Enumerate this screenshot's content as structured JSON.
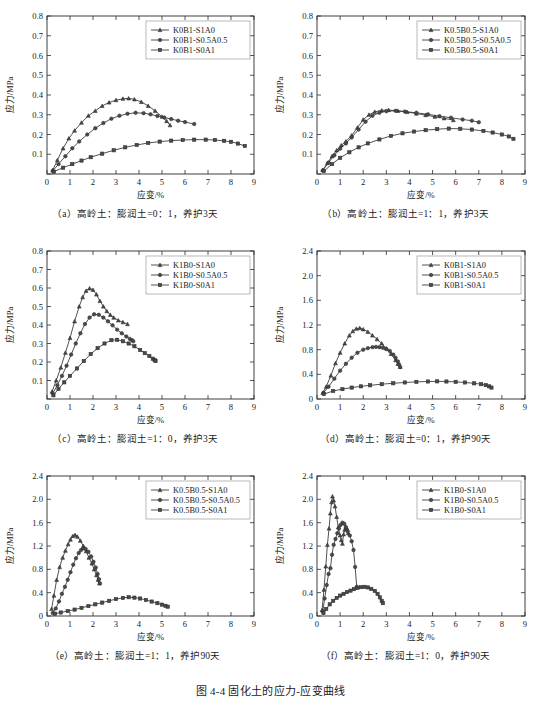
{
  "figure": {
    "caption": "图 4-4  固化土的应力-应变曲线",
    "axis_x_label": "应变/%",
    "axis_y_label": "应力/MPa"
  },
  "chart_data": [
    {
      "id": "a",
      "type": "line",
      "title": "（a）高岭土：膨润土=0：1，养护3天",
      "xlabel": "应变/%",
      "ylabel": "应力/MPa",
      "xlim": [
        0,
        9
      ],
      "ylim": [
        0,
        0.8
      ],
      "xticks": [
        0,
        1,
        2,
        3,
        4,
        5,
        6,
        7,
        8,
        9
      ],
      "yticks": [
        0,
        0.1,
        0.2,
        0.3,
        0.4,
        0.5,
        0.6,
        0.7,
        0.8
      ],
      "ytick_labels": [
        "",
        "0.1",
        "0.2",
        "0.3",
        "0.4",
        "0.5",
        "0.6",
        "0.7",
        "0.8"
      ],
      "grid": false,
      "legend_position": "top-right",
      "series": [
        {
          "name": "K0B1-S1A0",
          "marker": "triangle",
          "x": [
            0.25,
            0.45,
            0.7,
            0.95,
            1.2,
            1.5,
            1.8,
            2.1,
            2.4,
            2.7,
            3.0,
            3.3,
            3.55,
            3.8,
            4.1,
            4.4,
            4.7,
            5.0,
            5.2,
            5.35
          ],
          "y": [
            0.02,
            0.07,
            0.13,
            0.18,
            0.22,
            0.26,
            0.295,
            0.32,
            0.345,
            0.362,
            0.374,
            0.381,
            0.383,
            0.378,
            0.365,
            0.345,
            0.32,
            0.29,
            0.268,
            0.247
          ]
        },
        {
          "name": "K0B1-S0.5A0.5",
          "marker": "circle",
          "x": [
            0.25,
            0.5,
            0.8,
            1.1,
            1.4,
            1.75,
            2.1,
            2.45,
            2.8,
            3.15,
            3.5,
            3.85,
            4.2,
            4.5,
            4.8,
            5.1,
            5.4,
            5.7,
            6.0,
            6.4
          ],
          "y": [
            0.015,
            0.05,
            0.09,
            0.13,
            0.165,
            0.2,
            0.232,
            0.258,
            0.28,
            0.295,
            0.305,
            0.31,
            0.308,
            0.302,
            0.294,
            0.286,
            0.278,
            0.27,
            0.263,
            0.253
          ]
        },
        {
          "name": "K0B1-S0A1",
          "marker": "square",
          "x": [
            0.3,
            0.7,
            1.1,
            1.5,
            1.9,
            2.4,
            2.9,
            3.4,
            3.9,
            4.4,
            4.9,
            5.4,
            5.9,
            6.4,
            6.9,
            7.3,
            7.7,
            8.0,
            8.3,
            8.6
          ],
          "y": [
            0.012,
            0.032,
            0.05,
            0.068,
            0.085,
            0.103,
            0.12,
            0.135,
            0.147,
            0.157,
            0.164,
            0.169,
            0.172,
            0.174,
            0.174,
            0.172,
            0.168,
            0.163,
            0.154,
            0.142
          ]
        }
      ]
    },
    {
      "id": "b",
      "type": "line",
      "title": "（b）高岭土：膨润土=1：1，养护3天",
      "xlabel": "应变/%",
      "ylabel": "应力/MPa",
      "xlim": [
        0,
        9
      ],
      "ylim": [
        0,
        0.8
      ],
      "xticks": [
        0,
        1,
        2,
        3,
        4,
        5,
        6,
        7,
        8,
        9
      ],
      "yticks": [
        0,
        0.1,
        0.2,
        0.3,
        0.4,
        0.5,
        0.6,
        0.7,
        0.8
      ],
      "ytick_labels": [
        "",
        "0.1",
        "0.2",
        "0.3",
        "0.4",
        "0.5",
        "0.6",
        "0.7",
        "0.8"
      ],
      "grid": false,
      "legend_position": "top-right",
      "series": [
        {
          "name": "K0.5B0.5-S1A0",
          "marker": "triangle",
          "x": [
            0.25,
            0.45,
            0.65,
            0.85,
            1.05,
            1.25,
            1.5,
            1.75,
            2.0,
            2.25,
            2.5,
            2.8,
            3.1,
            3.5,
            3.9,
            4.3,
            4.7,
            5.1,
            5.5,
            5.9
          ],
          "y": [
            0.02,
            0.055,
            0.09,
            0.12,
            0.145,
            0.165,
            0.195,
            0.235,
            0.275,
            0.3,
            0.315,
            0.322,
            0.324,
            0.32,
            0.314,
            0.306,
            0.298,
            0.29,
            0.282,
            0.273
          ]
        },
        {
          "name": "K0.5B0.5-S0.5A0.5",
          "marker": "circle",
          "x": [
            0.25,
            0.5,
            0.75,
            1.0,
            1.25,
            1.5,
            1.8,
            2.1,
            2.4,
            2.7,
            3.0,
            3.4,
            3.8,
            4.3,
            4.8,
            5.3,
            5.8,
            6.3,
            6.7,
            7.0
          ],
          "y": [
            0.018,
            0.058,
            0.095,
            0.128,
            0.155,
            0.185,
            0.225,
            0.265,
            0.295,
            0.31,
            0.318,
            0.32,
            0.316,
            0.31,
            0.302,
            0.293,
            0.285,
            0.276,
            0.27,
            0.262
          ]
        },
        {
          "name": "K0.5B0.5-S0A1",
          "marker": "square",
          "x": [
            0.3,
            0.65,
            1.0,
            1.4,
            1.8,
            2.2,
            2.7,
            3.2,
            3.7,
            4.2,
            4.7,
            5.2,
            5.7,
            6.2,
            6.7,
            7.2,
            7.6,
            8.0,
            8.3,
            8.5
          ],
          "y": [
            0.015,
            0.05,
            0.082,
            0.11,
            0.135,
            0.155,
            0.175,
            0.193,
            0.206,
            0.215,
            0.222,
            0.227,
            0.23,
            0.229,
            0.225,
            0.218,
            0.21,
            0.2,
            0.19,
            0.178
          ]
        }
      ]
    },
    {
      "id": "c",
      "type": "line",
      "title": "（c）高岭土：膨润土=1：0，养护3天",
      "xlabel": "应变/%",
      "ylabel": "应力/MPa",
      "xlim": [
        0,
        9
      ],
      "ylim": [
        0,
        0.8
      ],
      "xticks": [
        0,
        1,
        2,
        3,
        4,
        5,
        6,
        7,
        8,
        9
      ],
      "yticks": [
        0,
        0.1,
        0.2,
        0.3,
        0.4,
        0.5,
        0.6,
        0.7,
        0.8
      ],
      "ytick_labels": [
        "",
        "0.1",
        "0.2",
        "0.3",
        "0.4",
        "0.5",
        "0.6",
        "0.7",
        "0.8"
      ],
      "grid": false,
      "legend_position": "top-right",
      "series": [
        {
          "name": "K1B0-S1A0",
          "marker": "triangle",
          "x": [
            0.22,
            0.4,
            0.6,
            0.8,
            1.0,
            1.2,
            1.4,
            1.55,
            1.7,
            1.85,
            2.0,
            2.15,
            2.3,
            2.45,
            2.6,
            2.75,
            2.9,
            3.1,
            3.3,
            3.5
          ],
          "y": [
            0.04,
            0.1,
            0.17,
            0.25,
            0.33,
            0.42,
            0.5,
            0.55,
            0.585,
            0.598,
            0.59,
            0.565,
            0.53,
            0.5,
            0.475,
            0.455,
            0.44,
            0.425,
            0.415,
            0.405
          ]
        },
        {
          "name": "K1B0-S0.5A0.5",
          "marker": "circle",
          "x": [
            0.25,
            0.45,
            0.65,
            0.85,
            1.05,
            1.25,
            1.45,
            1.65,
            1.85,
            2.05,
            2.25,
            2.45,
            2.65,
            2.85,
            3.05,
            3.25,
            3.45,
            3.6,
            3.7,
            3.75
          ],
          "y": [
            0.03,
            0.075,
            0.125,
            0.18,
            0.24,
            0.3,
            0.355,
            0.405,
            0.44,
            0.458,
            0.455,
            0.44,
            0.42,
            0.398,
            0.375,
            0.355,
            0.338,
            0.325,
            0.318,
            0.312
          ]
        },
        {
          "name": "K1B0-S0A1",
          "marker": "square",
          "x": [
            0.28,
            0.5,
            0.75,
            1.0,
            1.3,
            1.6,
            1.9,
            2.2,
            2.5,
            2.8,
            3.05,
            3.3,
            3.55,
            3.8,
            4.05,
            4.25,
            4.45,
            4.6,
            4.68,
            4.72
          ],
          "y": [
            0.02,
            0.055,
            0.09,
            0.125,
            0.165,
            0.205,
            0.243,
            0.275,
            0.3,
            0.318,
            0.32,
            0.312,
            0.3,
            0.285,
            0.265,
            0.248,
            0.232,
            0.218,
            0.21,
            0.205
          ]
        }
      ]
    },
    {
      "id": "d",
      "type": "line",
      "title": "（d）高岭土：膨润土=0：1，养护90天",
      "xlabel": "应变/%",
      "ylabel": "应力/MPa",
      "xlim": [
        0,
        9
      ],
      "ylim": [
        0,
        2.4
      ],
      "xticks": [
        0,
        1,
        2,
        3,
        4,
        5,
        6,
        7,
        8,
        9
      ],
      "yticks": [
        0,
        0.4,
        0.8,
        1.2,
        1.6,
        2.0,
        2.4
      ],
      "ytick_labels": [
        "0",
        "0.4",
        "0.8",
        "1.2",
        "1.6",
        "2.0",
        "2.4"
      ],
      "grid": false,
      "legend_position": "top-right",
      "series": [
        {
          "name": "K0B1-S1A0",
          "marker": "triangle",
          "x": [
            0.25,
            0.4,
            0.6,
            0.8,
            1.0,
            1.2,
            1.4,
            1.55,
            1.7,
            1.85,
            2.0,
            2.2,
            2.4,
            2.6,
            2.8,
            3.0,
            3.2,
            3.4,
            3.5,
            3.6
          ],
          "y": [
            0.1,
            0.2,
            0.38,
            0.58,
            0.75,
            0.9,
            1.03,
            1.1,
            1.14,
            1.15,
            1.13,
            1.09,
            1.03,
            0.97,
            0.9,
            0.82,
            0.73,
            0.63,
            0.57,
            0.52
          ]
        },
        {
          "name": "K0B1-S0.5A0.5",
          "marker": "circle",
          "x": [
            0.28,
            0.5,
            0.75,
            1.0,
            1.25,
            1.5,
            1.75,
            2.0,
            2.2,
            2.4,
            2.55,
            2.7,
            2.85,
            3.0,
            3.15,
            3.3,
            3.4,
            3.5,
            3.55,
            3.6
          ],
          "y": [
            0.1,
            0.2,
            0.33,
            0.46,
            0.57,
            0.67,
            0.75,
            0.8,
            0.825,
            0.84,
            0.845,
            0.84,
            0.83,
            0.81,
            0.78,
            0.72,
            0.67,
            0.61,
            0.56,
            0.52
          ]
        },
        {
          "name": "K0B1-S0A1",
          "marker": "square",
          "x": [
            0.3,
            0.7,
            1.1,
            1.5,
            1.9,
            2.3,
            2.8,
            3.3,
            3.8,
            4.3,
            4.8,
            5.2,
            5.6,
            6.0,
            6.4,
            6.8,
            7.1,
            7.3,
            7.45,
            7.55
          ],
          "y": [
            0.08,
            0.13,
            0.16,
            0.185,
            0.205,
            0.222,
            0.24,
            0.255,
            0.268,
            0.278,
            0.284,
            0.286,
            0.284,
            0.278,
            0.268,
            0.254,
            0.24,
            0.225,
            0.205,
            0.185
          ]
        }
      ]
    },
    {
      "id": "e",
      "type": "line",
      "title": "（e）高岭土：膨润土=1：1，养护90天",
      "xlabel": "应变/%",
      "ylabel": "应力/MPa",
      "xlim": [
        0,
        9
      ],
      "ylim": [
        0,
        2.4
      ],
      "xticks": [
        0,
        1,
        2,
        3,
        4,
        5,
        6,
        7,
        8,
        9
      ],
      "yticks": [
        0,
        0.4,
        0.8,
        1.2,
        1.6,
        2.0,
        2.4
      ],
      "ytick_labels": [
        "0",
        "0.4",
        "0.8",
        "1.2",
        "1.6",
        "2.0",
        "2.4"
      ],
      "grid": false,
      "legend_position": "top-right",
      "series": [
        {
          "name": "K0.5B0.5-S1A0",
          "marker": "triangle",
          "x": [
            0.2,
            0.3,
            0.42,
            0.55,
            0.68,
            0.8,
            0.92,
            1.02,
            1.12,
            1.22,
            1.32,
            1.45,
            1.58,
            1.7,
            1.82,
            1.95,
            2.05,
            2.15,
            2.22,
            2.28
          ],
          "y": [
            0.12,
            0.35,
            0.62,
            0.84,
            1.0,
            1.12,
            1.23,
            1.31,
            1.37,
            1.39,
            1.36,
            1.29,
            1.2,
            1.11,
            1.0,
            0.9,
            0.8,
            0.7,
            0.62,
            0.56
          ]
        },
        {
          "name": "K0.5B0.5-S0.5A0.5",
          "marker": "circle",
          "x": [
            0.25,
            0.38,
            0.52,
            0.65,
            0.78,
            0.9,
            1.02,
            1.14,
            1.26,
            1.38,
            1.48,
            1.58,
            1.68,
            1.8,
            1.92,
            2.02,
            2.12,
            2.2,
            2.26,
            2.3
          ],
          "y": [
            0.05,
            0.13,
            0.25,
            0.38,
            0.5,
            0.62,
            0.75,
            0.88,
            0.99,
            1.08,
            1.13,
            1.16,
            1.15,
            1.1,
            1.02,
            0.93,
            0.83,
            0.72,
            0.63,
            0.56
          ]
        },
        {
          "name": "K0.5B0.5-S0A1",
          "marker": "square",
          "x": [
            0.35,
            0.6,
            0.9,
            1.2,
            1.5,
            1.8,
            2.1,
            2.4,
            2.7,
            3.0,
            3.3,
            3.55,
            3.8,
            4.05,
            4.3,
            4.55,
            4.8,
            5.0,
            5.15,
            5.25
          ],
          "y": [
            0.04,
            0.06,
            0.085,
            0.11,
            0.14,
            0.17,
            0.2,
            0.23,
            0.26,
            0.29,
            0.31,
            0.322,
            0.315,
            0.3,
            0.275,
            0.248,
            0.22,
            0.195,
            0.175,
            0.16
          ]
        }
      ]
    },
    {
      "id": "f",
      "type": "line",
      "title": "（f）高岭土：膨润土=1：0，养护90天",
      "xlabel": "应变/%",
      "ylabel": "应力/MPa",
      "xlim": [
        0,
        9
      ],
      "ylim": [
        0,
        2.4
      ],
      "xticks": [
        0,
        1,
        2,
        3,
        4,
        5,
        6,
        7,
        8,
        9
      ],
      "yticks": [
        0,
        0.4,
        0.8,
        1.2,
        1.6,
        2.0,
        2.4
      ],
      "ytick_labels": [
        "0",
        "0.4",
        "0.8",
        "1.2",
        "1.6",
        "2.0",
        "2.4"
      ],
      "grid": false,
      "legend_position": "top-right",
      "series": [
        {
          "name": "K1B0-S1A0",
          "marker": "triangle",
          "x": [
            0.22,
            0.3,
            0.38,
            0.45,
            0.52,
            0.58,
            0.63,
            0.67,
            0.72,
            0.78,
            0.85,
            0.92,
            1.0,
            1.05,
            1.1,
            1.15,
            1.2,
            1.25,
            1.3,
            1.35
          ],
          "y": [
            0.1,
            0.45,
            0.85,
            1.22,
            1.5,
            1.76,
            1.95,
            2.05,
            1.98,
            1.88,
            1.7,
            1.52,
            1.38,
            1.3,
            1.24,
            1.4,
            1.48,
            1.53,
            1.5,
            1.42
          ]
        },
        {
          "name": "K1B0-S0.5A0.5",
          "marker": "circle",
          "x": [
            0.25,
            0.33,
            0.42,
            0.5,
            0.58,
            0.65,
            0.72,
            0.8,
            0.88,
            0.95,
            1.02,
            1.1,
            1.18,
            1.25,
            1.33,
            1.42,
            1.5,
            1.58,
            1.65,
            1.72
          ],
          "y": [
            0.08,
            0.3,
            0.53,
            0.72,
            0.82,
            1.05,
            1.22,
            1.32,
            1.42,
            1.5,
            1.56,
            1.6,
            1.58,
            1.52,
            1.45,
            1.38,
            1.28,
            1.13,
            0.84,
            0.5
          ]
        },
        {
          "name": "K1B0-S0A1",
          "marker": "square",
          "x": [
            0.28,
            0.4,
            0.55,
            0.7,
            0.85,
            1.0,
            1.15,
            1.3,
            1.45,
            1.6,
            1.75,
            1.9,
            2.05,
            2.2,
            2.35,
            2.5,
            2.62,
            2.72,
            2.8,
            2.85
          ],
          "y": [
            0.05,
            0.12,
            0.2,
            0.26,
            0.31,
            0.35,
            0.38,
            0.41,
            0.435,
            0.46,
            0.48,
            0.495,
            0.5,
            0.49,
            0.465,
            0.43,
            0.38,
            0.32,
            0.26,
            0.22
          ]
        }
      ]
    }
  ]
}
